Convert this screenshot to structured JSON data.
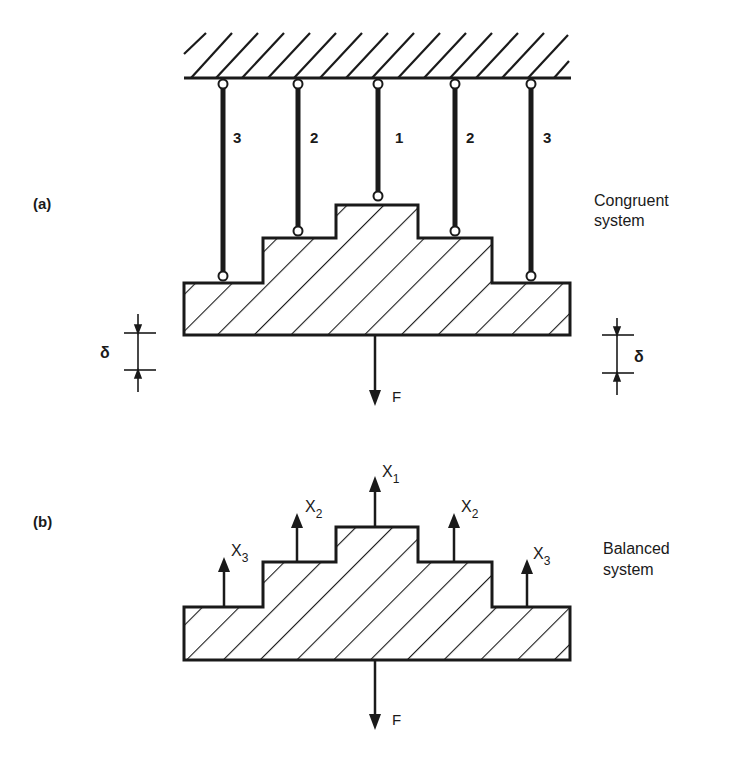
{
  "figure": {
    "part_a": {
      "label": "(a)",
      "caption_line1": "Congruent",
      "caption_line2": "system",
      "rods": [
        {
          "id": "3",
          "x": 223,
          "bottom": 276
        },
        {
          "id": "2",
          "x": 298,
          "bottom": 231
        },
        {
          "id": "1",
          "x": 378,
          "bottom": 196
        },
        {
          "id": "2",
          "x": 455,
          "bottom": 231
        },
        {
          "id": "3",
          "x": 531,
          "bottom": 276
        }
      ],
      "force_label": "F",
      "displacement_symbol": "δ"
    },
    "part_b": {
      "label": "(b)",
      "caption_line1": "Balanced",
      "caption_line2": "system",
      "reactions": [
        {
          "name": "X",
          "sub": "3"
        },
        {
          "name": "X",
          "sub": "2"
        },
        {
          "name": "X",
          "sub": "1"
        },
        {
          "name": "X",
          "sub": "2"
        },
        {
          "name": "X",
          "sub": "3"
        }
      ],
      "force_label": "F"
    }
  },
  "colors": {
    "ink": "#1a1a1a",
    "background": "#ffffff"
  }
}
